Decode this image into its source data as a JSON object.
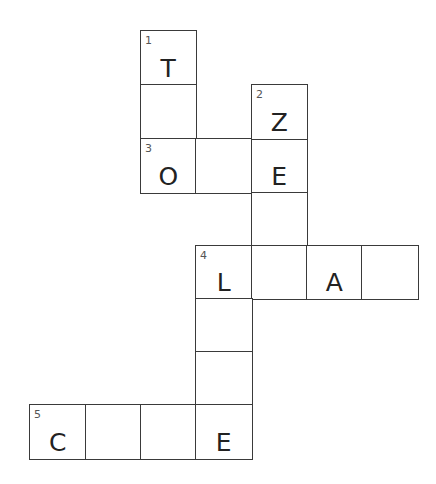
{
  "puzzle": {
    "layout": {
      "col_x": [
        29,
        85,
        140,
        195,
        251,
        306,
        361
      ],
      "row_y": [
        30,
        84,
        138,
        192,
        245,
        298,
        351,
        404
      ],
      "cell_w": 56,
      "cell_h": 54
    },
    "cells": [
      {
        "row": 0,
        "col": 2,
        "num": "1",
        "letter": "T"
      },
      {
        "row": 1,
        "col": 2,
        "num": "",
        "letter": ""
      },
      {
        "row": 2,
        "col": 2,
        "num": "3",
        "letter": "O"
      },
      {
        "row": 2,
        "col": 3,
        "num": "",
        "letter": ""
      },
      {
        "row": 2,
        "col": 4,
        "num": "",
        "letter": "E"
      },
      {
        "row": 1,
        "col": 4,
        "num": "2",
        "letter": "Z"
      },
      {
        "row": 3,
        "col": 4,
        "num": "",
        "letter": ""
      },
      {
        "row": 4,
        "col": 3,
        "num": "4",
        "letter": "L"
      },
      {
        "row": 4,
        "col": 4,
        "num": "",
        "letter": ""
      },
      {
        "row": 4,
        "col": 5,
        "num": "",
        "letter": "A"
      },
      {
        "row": 4,
        "col": 6,
        "num": "",
        "letter": ""
      },
      {
        "row": 5,
        "col": 3,
        "num": "",
        "letter": ""
      },
      {
        "row": 6,
        "col": 3,
        "num": "",
        "letter": ""
      },
      {
        "row": 7,
        "col": 0,
        "num": "5",
        "letter": "C"
      },
      {
        "row": 7,
        "col": 1,
        "num": "",
        "letter": ""
      },
      {
        "row": 7,
        "col": 2,
        "num": "",
        "letter": ""
      },
      {
        "row": 7,
        "col": 3,
        "num": "",
        "letter": "E"
      }
    ],
    "entries": [
      {
        "number": "1",
        "direction": "down",
        "start": [
          0,
          2
        ],
        "length": 3,
        "pattern": "T _ O"
      },
      {
        "number": "2",
        "direction": "down",
        "start": [
          1,
          4
        ],
        "length": 4,
        "pattern": "Z E _ _"
      },
      {
        "number": "3",
        "direction": "across",
        "start": [
          2,
          2
        ],
        "length": 3,
        "pattern": "O _ E"
      },
      {
        "number": "4",
        "direction": "across",
        "start": [
          4,
          3
        ],
        "length": 4,
        "pattern": "L _ A _"
      },
      {
        "number": "4",
        "direction": "down",
        "start": [
          4,
          3
        ],
        "length": 4,
        "pattern": "L _ _ E"
      },
      {
        "number": "5",
        "direction": "across",
        "start": [
          7,
          0
        ],
        "length": 4,
        "pattern": "C _ _ E"
      }
    ]
  }
}
